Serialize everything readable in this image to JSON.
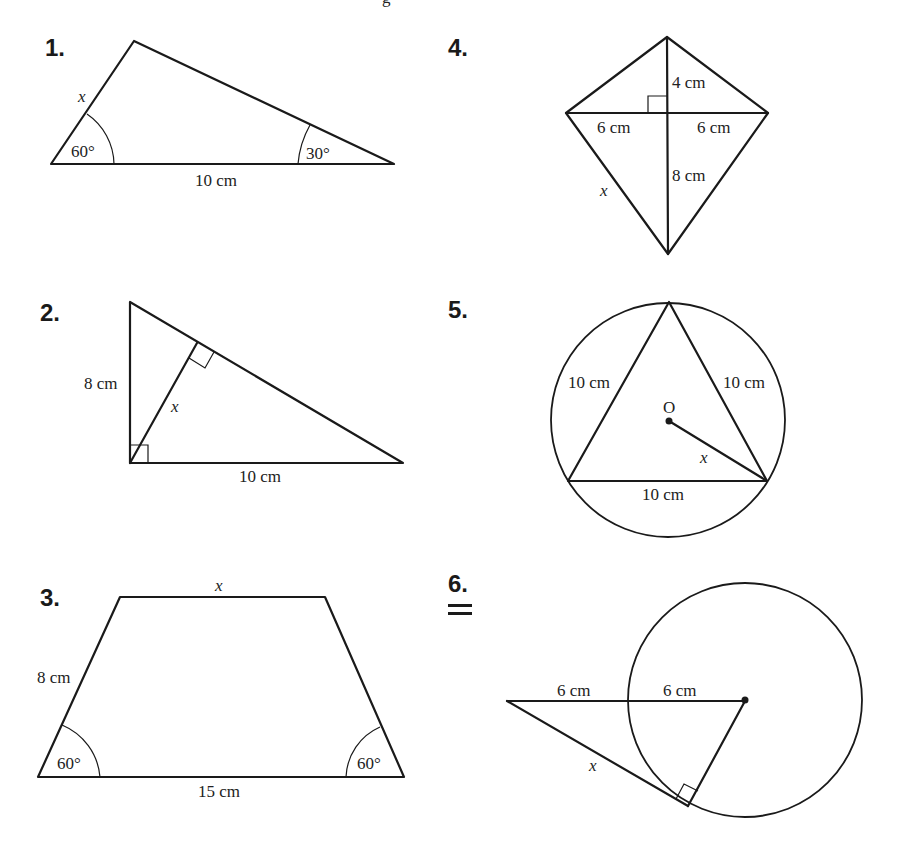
{
  "page": {
    "top_partial_text": "g"
  },
  "problems": [
    {
      "number": "1.",
      "shape": "triangle",
      "labels": {
        "side_unknown": "x",
        "angle_left": "60°",
        "angle_right": "30°",
        "base": "10 cm"
      }
    },
    {
      "number": "2.",
      "shape": "right triangle with altitude",
      "labels": {
        "left_side": "8 cm",
        "altitude": "x",
        "base": "10 cm"
      }
    },
    {
      "number": "3.",
      "shape": "isosceles trapezoid",
      "labels": {
        "top": "x",
        "left_side": "8 cm",
        "angle_left": "60°",
        "angle_right": "60°",
        "base": "15 cm"
      }
    },
    {
      "number": "4.",
      "shape": "kite",
      "labels": {
        "upper_diag": "4 cm",
        "left_half": "6 cm",
        "right_half": "6 cm",
        "lower_diag": "8 cm",
        "side_unknown": "x"
      }
    },
    {
      "number": "5.",
      "shape": "equilateral triangle inscribed in circle",
      "labels": {
        "left": "10 cm",
        "right": "10 cm",
        "base": "10 cm",
        "center": "O",
        "radius": "x"
      }
    },
    {
      "number": "6.",
      "shape": "tangent to circle",
      "labels": {
        "outer": "6 cm",
        "inner": "6 cm",
        "tangent": "x"
      }
    }
  ]
}
